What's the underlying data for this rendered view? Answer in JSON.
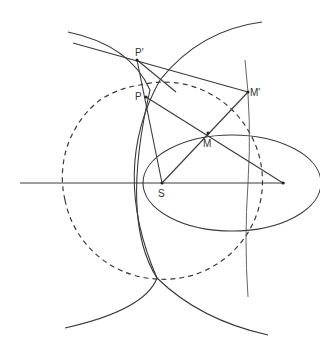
{
  "diagram": {
    "type": "geometric-construction",
    "labels": {
      "S": "S",
      "P": "P",
      "P_prime": "P'",
      "M": "M",
      "M_prime": "M'"
    },
    "points": {
      "S": [
        162,
        183
      ],
      "P": [
        146,
        97
      ],
      "P_prime": [
        137,
        60
      ],
      "M": [
        208,
        133
      ],
      "M_prime": [
        248,
        92
      ],
      "F2": [
        283,
        183
      ]
    },
    "ellipse": {
      "cx": 232,
      "cy": 183,
      "rx": 89,
      "ry": 48
    },
    "dashed_circle": {
      "cx": 162,
      "cy": 183,
      "r": 98
    },
    "axis": {
      "x1": 20,
      "x2": 285,
      "y": 183
    },
    "colors": {
      "stroke": "#3a3a3a",
      "background": "#ffffff"
    }
  }
}
